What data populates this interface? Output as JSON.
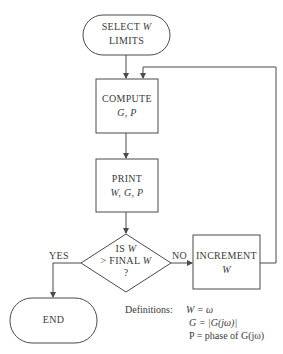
{
  "nodes": {
    "start": {
      "line1": "SELECT W",
      "line1_prefix": "SELECT ",
      "line1_var": "W",
      "line2": "LIMITS"
    },
    "compute": {
      "line1": "COMPUTE",
      "line2": "G, P"
    },
    "print": {
      "line1": "PRINT",
      "line2": "W, G, P"
    },
    "decision": {
      "line1": "IS W",
      "line1_prefix": "IS ",
      "line1_var": "W",
      "line2": "> FINAL W",
      "line2_prefix": "> FINAL ",
      "line2_var": "W",
      "line3": "?"
    },
    "increment": {
      "line1": "INCREMENT",
      "line2": "W"
    },
    "end": {
      "line1": "END"
    }
  },
  "edges": {
    "yes_label": "YES",
    "no_label": "NO"
  },
  "definitions": {
    "title": "Definitions:",
    "rows": [
      {
        "lhs": "W",
        "rhs": "= ω"
      },
      {
        "lhs": "G",
        "rhs": "= |G(jω)|"
      },
      {
        "lhs": "P",
        "rhs": "= phase of G(jω)"
      }
    ]
  },
  "colors": {
    "stroke": "#4a4a4a",
    "text": "#3a3a3a",
    "background": "#ffffff"
  }
}
